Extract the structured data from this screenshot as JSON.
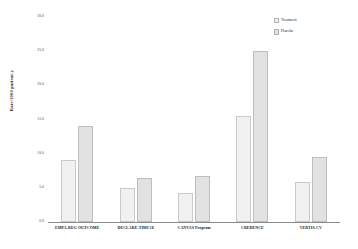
{
  "chart_data": {
    "type": "bar",
    "title": "",
    "xlabel": "",
    "ylabel": "Rate/1000 patient-y",
    "ylim": [
      0,
      30
    ],
    "yticks": [
      "30.0",
      "25.0",
      "20.0",
      "15.0",
      "10.0",
      "5.0",
      "0.0"
    ],
    "ytick_values": [
      30,
      25,
      20,
      15,
      10,
      5,
      0
    ],
    "grid": false,
    "legend_position": "top-right",
    "categories": [
      "EMPA-REG OUTCOME",
      "DECLARE-TIMI 58",
      "CANVAS Program",
      "CREDENCE",
      "VERTIS-CV"
    ],
    "series": [
      {
        "name": "Treatment",
        "color": "#f1f1f1",
        "values": [
          9.1,
          5.0,
          4.2,
          15.5,
          5.9
        ]
      },
      {
        "name": "Placebo",
        "color": "#e2e2e2",
        "values": [
          14.1,
          6.4,
          6.7,
          25.0,
          9.5
        ]
      }
    ]
  },
  "legend": {
    "items": [
      {
        "label": "Treatment",
        "swatch": "treatment"
      },
      {
        "label": "Placebo",
        "swatch": "placebo"
      }
    ]
  }
}
